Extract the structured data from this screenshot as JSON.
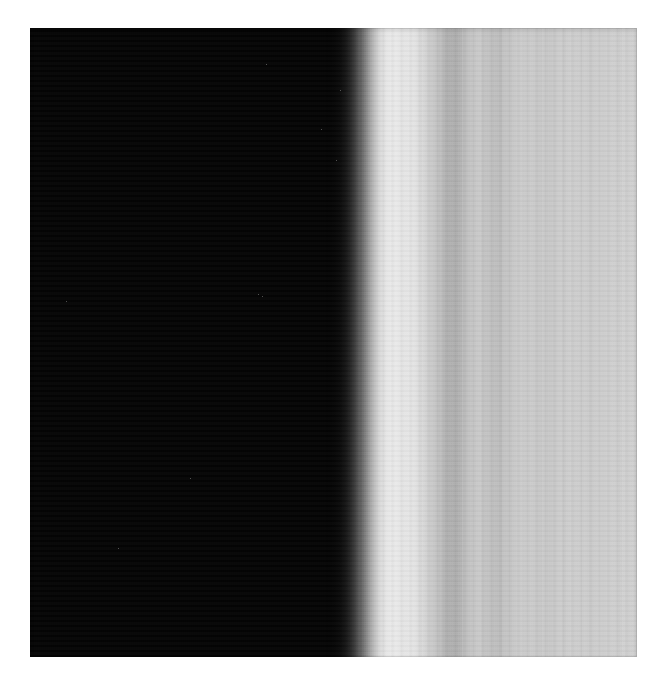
{
  "page": {
    "background_color": "#ffffff",
    "width": 668,
    "height": 687,
    "caption": ""
  },
  "figure": {
    "title": "",
    "kind": "grayscale-intensity-scan",
    "plate_left": 30,
    "plate_top": 28,
    "plate_width": 607,
    "plate_height": 629,
    "background_color": "#000000",
    "description": ""
  },
  "chart_data": {
    "type": "heatmap",
    "title": "",
    "subtitle": "",
    "xlabel": "",
    "ylabel": "",
    "grid": false,
    "legend": "none",
    "orientation": "vertical-bands",
    "colormap": "grayscale",
    "value_range": [
      0,
      255
    ],
    "xlim": [
      0,
      607
    ],
    "ylim": [
      0,
      629
    ],
    "x": [
      0,
      295,
      300,
      305,
      310,
      315,
      320,
      325,
      330,
      335,
      340,
      345,
      350,
      355,
      360,
      365,
      370,
      375,
      380,
      385,
      390,
      395,
      400,
      405,
      410,
      415,
      420,
      425,
      430,
      435,
      440,
      445,
      450,
      460,
      470,
      480,
      490,
      500,
      510,
      520,
      530,
      540,
      550,
      560,
      570,
      580,
      590,
      600,
      607
    ],
    "values": [
      3,
      3,
      4,
      6,
      10,
      18,
      34,
      58,
      92,
      130,
      166,
      196,
      216,
      228,
      233,
      234,
      232,
      230,
      231,
      228,
      221,
      212,
      203,
      196,
      190,
      184,
      180,
      179,
      182,
      188,
      194,
      198,
      200,
      197,
      192,
      196,
      203,
      206,
      202,
      198,
      203,
      209,
      207,
      201,
      205,
      210,
      208,
      206,
      207
    ],
    "bands": [
      {
        "x0": 0,
        "x1": 296,
        "level": 3,
        "label": "saturated-black-field"
      },
      {
        "x0": 296,
        "x1": 312,
        "level": 9,
        "label": "toe-of-rise"
      },
      {
        "x0": 312,
        "x1": 330,
        "level": 60,
        "label": "steep-edge"
      },
      {
        "x0": 330,
        "x1": 348,
        "level": 168,
        "label": "upper-edge"
      },
      {
        "x0": 348,
        "x1": 368,
        "level": 228,
        "label": "bright-peak"
      },
      {
        "x0": 368,
        "x1": 392,
        "level": 231,
        "label": "plateau"
      },
      {
        "x0": 392,
        "x1": 412,
        "level": 208,
        "label": "first-falloff"
      },
      {
        "x0": 412,
        "x1": 432,
        "level": 181,
        "label": "first-dark-fringe"
      },
      {
        "x0": 432,
        "x1": 452,
        "level": 197,
        "label": "second-bright-fringe"
      },
      {
        "x0": 452,
        "x1": 472,
        "level": 191,
        "label": "second-dark-fringe"
      },
      {
        "x0": 472,
        "x1": 492,
        "level": 200,
        "label": "third-bright-fringe"
      },
      {
        "x0": 492,
        "x1": 512,
        "level": 205,
        "label": "fourth-bright-fringe"
      },
      {
        "x0": 512,
        "x1": 532,
        "level": 198,
        "label": "third-dark-fringe"
      },
      {
        "x0": 532,
        "x1": 552,
        "level": 208,
        "label": "fifth-bright-fringe"
      },
      {
        "x0": 552,
        "x1": 572,
        "level": 202,
        "label": "fourth-dark-fringe"
      },
      {
        "x0": 572,
        "x1": 592,
        "level": 210,
        "label": "sixth-bright-fringe"
      },
      {
        "x0": 592,
        "x1": 607,
        "level": 206,
        "label": "right-edge-gray"
      }
    ]
  },
  "specks": [
    {
      "x": 236,
      "y": 36
    },
    {
      "x": 291,
      "y": 101
    },
    {
      "x": 36,
      "y": 273
    },
    {
      "x": 228,
      "y": 266
    },
    {
      "x": 232,
      "y": 268
    },
    {
      "x": 310,
      "y": 62
    },
    {
      "x": 306,
      "y": 132
    },
    {
      "x": 160,
      "y": 450
    },
    {
      "x": 88,
      "y": 520
    }
  ]
}
